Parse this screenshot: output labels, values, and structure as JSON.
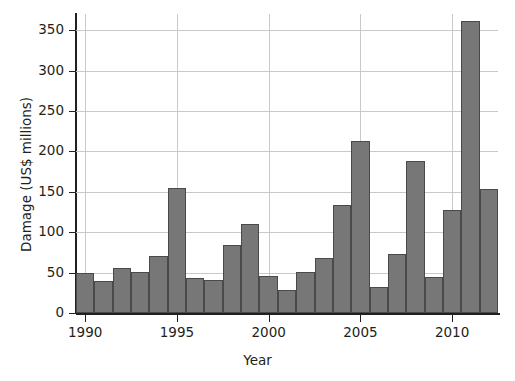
{
  "chart_data": {
    "type": "bar",
    "title": "",
    "xlabel": "Year",
    "ylabel": "Damage (US$ millions)",
    "categories": [
      1990,
      1991,
      1992,
      1993,
      1994,
      1995,
      1996,
      1997,
      1998,
      1999,
      2000,
      2001,
      2002,
      2003,
      2004,
      2005,
      2006,
      2007,
      2008,
      2009,
      2010,
      2011,
      2012
    ],
    "values": [
      50,
      40,
      56,
      51,
      71,
      155,
      43,
      41,
      84,
      110,
      46,
      28,
      51,
      68,
      134,
      213,
      32,
      73,
      188,
      45,
      128,
      361,
      154
    ],
    "xlim": [
      1989.5,
      2012.5
    ],
    "ylim": [
      0,
      370
    ],
    "yticks": [
      0,
      50,
      100,
      150,
      200,
      250,
      300,
      350
    ],
    "ytick_labels": [
      "0",
      "50",
      "100",
      "150",
      "200",
      "250",
      "300",
      "350"
    ],
    "xticks": [
      1990,
      1995,
      2000,
      2005,
      2010
    ],
    "xtick_labels": [
      "1990",
      "1995",
      "2000",
      "2005",
      "2010"
    ],
    "grid": {
      "horizontal": true,
      "vertical": true
    },
    "legend": null,
    "colors": {
      "bar_fill": "#777777",
      "bar_edge": "#4a4a4a",
      "grid": "#c9c9c9",
      "axis": "#231f20",
      "text": "#231f20",
      "background": "#ffffff"
    }
  }
}
